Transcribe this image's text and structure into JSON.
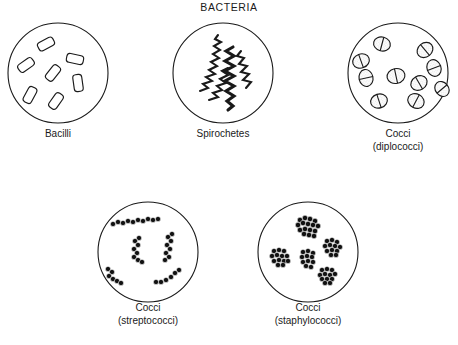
{
  "figure": {
    "title": "BACTERIA",
    "background_color": "#ffffff",
    "ink_color": "#1a1a1a",
    "panels": [
      {
        "id": "bacilli",
        "label": "Bacilli",
        "sublabel": "",
        "morphology": "rod-shaped",
        "cell_count": 7,
        "row": 1,
        "column": 1
      },
      {
        "id": "spirochetes",
        "label": "Spirochetes",
        "sublabel": "",
        "morphology": "helical-spiral",
        "cell_count": 4,
        "row": 1,
        "column": 2
      },
      {
        "id": "diplococci",
        "label": "Cocci",
        "sublabel": "(diplococci)",
        "morphology": "paired-spheres",
        "cell_count": 10,
        "row": 1,
        "column": 3
      },
      {
        "id": "streptococci",
        "label": "Cocci",
        "sublabel": "(streptococci)",
        "morphology": "chains-of-spheres",
        "cell_count": 5,
        "row": 2,
        "column": 1
      },
      {
        "id": "staphylococci",
        "label": "Cocci",
        "sublabel": "(staphylococci)",
        "morphology": "grape-like-clusters",
        "cell_count": 5,
        "row": 2,
        "column": 2
      }
    ]
  }
}
